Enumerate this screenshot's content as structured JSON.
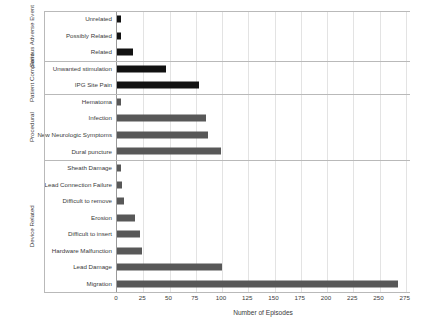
{
  "chart_data": {
    "type": "bar",
    "orientation": "horizontal",
    "title": "",
    "xlabel": "Number of Episodes",
    "ylabel": "",
    "xlim": [
      0,
      280
    ],
    "xticks": [
      0,
      25,
      50,
      75,
      100,
      125,
      150,
      175,
      200,
      225,
      250,
      275
    ],
    "grid": "vertical",
    "legend": "none",
    "colors": {
      "dark": "#121212",
      "grey": "#585858",
      "grid": "#e3e3e3",
      "axis": "#9a9a9a",
      "text": "#3a3a3a"
    },
    "groups": [
      {
        "name": "Serious Adverse Event",
        "color_key": "dark",
        "items": [
          {
            "label": "Unrelated",
            "value": 4
          },
          {
            "label": "Possibly Related",
            "value": 4
          },
          {
            "label": "Related",
            "value": 15
          }
        ]
      },
      {
        "name": "Patient Complaint",
        "color_key": "dark",
        "items": [
          {
            "label": "Unwanted stimulation",
            "value": 47
          },
          {
            "label": "IPG Site Pain",
            "value": 78
          }
        ]
      },
      {
        "name": "Procedural",
        "color_key": "grey",
        "items": [
          {
            "label": "Hematoma",
            "value": 4
          },
          {
            "label": "Infection",
            "value": 85
          },
          {
            "label": "New Neurologic Symptoms",
            "value": 87
          },
          {
            "label": "Dural puncture",
            "value": 99
          }
        ]
      },
      {
        "name": "Device Related",
        "color_key": "grey",
        "items": [
          {
            "label": "Sheath Damage",
            "value": 4
          },
          {
            "label": "Lead Connection Failure",
            "value": 5
          },
          {
            "label": "Difficult to remove",
            "value": 7
          },
          {
            "label": "Erosion",
            "value": 17
          },
          {
            "label": "Difficult to insert",
            "value": 22
          },
          {
            "label": "Hardware Malfunction",
            "value": 24
          },
          {
            "label": "Lead Damage",
            "value": 100
          },
          {
            "label": "Migration",
            "value": 268
          }
        ]
      }
    ]
  }
}
